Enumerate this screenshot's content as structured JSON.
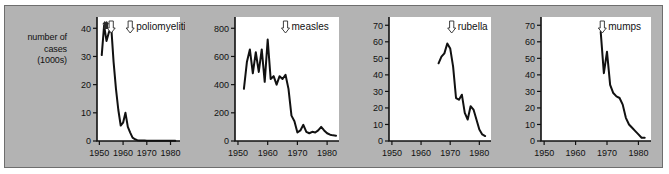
{
  "figure": {
    "y_axis_title": "number of\ncases\n(1000s)",
    "background_color": "#b3b3b3",
    "plot_background_color": "#ffffff",
    "line_color": "#111111"
  },
  "chart_data": [
    {
      "type": "line",
      "title": "poliomyelitis",
      "xlabel": "",
      "ylabel": "number of cases (1000s)",
      "xlim": [
        1949,
        1984
      ],
      "ylim": [
        0,
        44
      ],
      "xticks": [
        1950,
        1960,
        1970,
        1980
      ],
      "yticks": [
        0,
        10,
        20,
        30,
        40
      ],
      "grid": false,
      "legend": "none",
      "annotations": [
        {
          "type": "arrow-up",
          "label": "",
          "x": 1952.3
        },
        {
          "type": "arrow-up",
          "label": "",
          "x": 1953.1
        },
        {
          "type": "arrow-down-hollow",
          "label": "",
          "x": 1955.0
        },
        {
          "type": "arrow-down-hollow",
          "label": "poliomyelitis",
          "x": 1963.0
        }
      ],
      "x": [
        1951,
        1952,
        1953,
        1954,
        1955,
        1956,
        1957,
        1958,
        1959,
        1960,
        1961,
        1962,
        1963,
        1964,
        1965,
        1966,
        1967,
        1968,
        1969,
        1970,
        1971,
        1972,
        1973,
        1974,
        1975,
        1976,
        1977,
        1978,
        1979,
        1980,
        1981,
        1982
      ],
      "y": [
        30.5,
        41.0,
        35.5,
        38.5,
        40.5,
        28.0,
        18.5,
        11.0,
        5.5,
        6.5,
        10.0,
        5.0,
        3.0,
        1.2,
        0.6,
        0.3,
        0.2,
        0.2,
        0.2,
        0.1,
        0.1,
        0.1,
        0.1,
        0.1,
        0.1,
        0.1,
        0.1,
        0.1,
        0.1,
        0.1,
        0.1,
        0.1
      ]
    },
    {
      "type": "line",
      "title": "measles",
      "xlabel": "",
      "ylabel": "",
      "xlim": [
        1949,
        1984
      ],
      "ylim": [
        0,
        880
      ],
      "xticks": [
        1950,
        1960,
        1970,
        1980
      ],
      "yticks": [
        0,
        200,
        400,
        600,
        800
      ],
      "grid": false,
      "legend": "none",
      "annotations": [
        {
          "type": "arrow-down-hollow",
          "label": "measles",
          "x": 1966.0
        }
      ],
      "x": [
        1952,
        1953,
        1954,
        1955,
        1956,
        1957,
        1958,
        1959,
        1960,
        1961,
        1962,
        1963,
        1964,
        1965,
        1966,
        1967,
        1968,
        1969,
        1970,
        1971,
        1972,
        1973,
        1974,
        1975,
        1976,
        1977,
        1978,
        1979,
        1980,
        1981,
        1982,
        1983
      ],
      "y": [
        370,
        560,
        650,
        480,
        630,
        490,
        650,
        420,
        720,
        440,
        460,
        400,
        460,
        440,
        470,
        370,
        180,
        140,
        60,
        75,
        115,
        65,
        55,
        65,
        60,
        75,
        100,
        75,
        55,
        45,
        40,
        38
      ]
    },
    {
      "type": "line",
      "title": "rubella",
      "xlabel": "",
      "ylabel": "",
      "xlim": [
        1949,
        1984
      ],
      "ylim": [
        0,
        75
      ],
      "xticks": [
        1950,
        1960,
        1970,
        1980
      ],
      "yticks": [
        0,
        10,
        20,
        30,
        40,
        50,
        60,
        70
      ],
      "grid": false,
      "legend": "none",
      "annotations": [
        {
          "type": "arrow-down-hollow",
          "label": "rubella",
          "x": 1970.5
        }
      ],
      "x": [
        1966,
        1967,
        1968,
        1969,
        1970,
        1971,
        1972,
        1973,
        1974,
        1975,
        1976,
        1977,
        1978,
        1979,
        1980,
        1981,
        1982
      ],
      "y": [
        47,
        51,
        53,
        59,
        56,
        45,
        26,
        25,
        28,
        17,
        13,
        21,
        19,
        13,
        7,
        4,
        3
      ]
    },
    {
      "type": "line",
      "title": "mumps",
      "xlabel": "",
      "ylabel": "",
      "xlim": [
        1949,
        1984
      ],
      "ylim": [
        0,
        75
      ],
      "xticks": [
        1950,
        1960,
        1970,
        1980
      ],
      "yticks": [
        0,
        10,
        20,
        30,
        40,
        50,
        60,
        70
      ],
      "grid": false,
      "legend": "none",
      "annotations": [
        {
          "type": "arrow-down-hollow",
          "label": "mumps",
          "x": 1968.5
        }
      ],
      "x": [
        1968,
        1969,
        1970,
        1971,
        1972,
        1973,
        1974,
        1975,
        1976,
        1977,
        1978,
        1979,
        1980,
        1981,
        1982
      ],
      "y": [
        66,
        41,
        54,
        34,
        29,
        27,
        26,
        22,
        14,
        10,
        8,
        6,
        4,
        2,
        2
      ]
    }
  ]
}
